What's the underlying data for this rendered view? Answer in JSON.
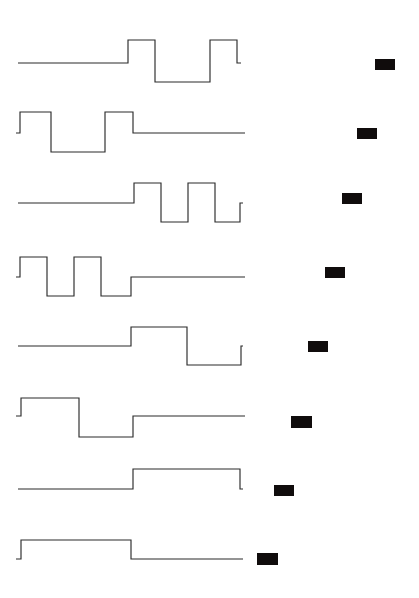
{
  "figure": {
    "title": "Digital waveform timing diagram",
    "background_color": "#ffffff",
    "trace_color": "#2b2b2b",
    "marker_color": "#100c0c",
    "width": 419,
    "height": 598
  },
  "chart_data": {
    "type": "line",
    "title": "Digital waveform timing diagram",
    "subtitle": "",
    "xlabel": "",
    "ylabel": "",
    "grid": false,
    "legend": "none",
    "xlim": [
      0,
      419
    ],
    "ylim": [
      0,
      598
    ],
    "level_names": [
      "low",
      "mid",
      "high"
    ],
    "series": [
      {
        "name": "trace-1",
        "row_index": 1,
        "baseline_y": 63,
        "levels": {
          "high": 40,
          "mid": 63,
          "low": 82
        },
        "x_start": 18,
        "x_end": 241,
        "segments": [
          {
            "x0": 18,
            "x1": 128,
            "level": "mid"
          },
          {
            "x0": 128,
            "x1": 155,
            "level": "high"
          },
          {
            "x0": 155,
            "x1": 210,
            "level": "low"
          },
          {
            "x0": 210,
            "x1": 237,
            "level": "high"
          },
          {
            "x0": 237,
            "x1": 241,
            "level": "mid"
          }
        ],
        "marker": {
          "x": 375,
          "y": 59,
          "width": 20,
          "height": 11
        }
      },
      {
        "name": "trace-2",
        "row_index": 2,
        "baseline_y": 133,
        "levels": {
          "high": 112,
          "mid": 133,
          "low": 152
        },
        "x_start": 16,
        "x_end": 245,
        "segments": [
          {
            "x0": 16,
            "x1": 20,
            "level": "mid"
          },
          {
            "x0": 20,
            "x1": 51,
            "level": "high"
          },
          {
            "x0": 51,
            "x1": 105,
            "level": "low"
          },
          {
            "x0": 105,
            "x1": 133,
            "level": "high"
          },
          {
            "x0": 133,
            "x1": 245,
            "level": "mid"
          }
        ],
        "marker": {
          "x": 357,
          "y": 128,
          "width": 20,
          "height": 11
        }
      },
      {
        "name": "trace-3",
        "row_index": 3,
        "baseline_y": 203,
        "levels": {
          "high": 183,
          "mid": 203,
          "low": 222
        },
        "x_start": 18,
        "x_end": 243,
        "segments": [
          {
            "x0": 18,
            "x1": 134,
            "level": "mid"
          },
          {
            "x0": 134,
            "x1": 161,
            "level": "high"
          },
          {
            "x0": 161,
            "x1": 188,
            "level": "low"
          },
          {
            "x0": 188,
            "x1": 215,
            "level": "high"
          },
          {
            "x0": 215,
            "x1": 240,
            "level": "low"
          },
          {
            "x0": 240,
            "x1": 243,
            "level": "mid"
          }
        ],
        "marker": {
          "x": 342,
          "y": 193,
          "width": 20,
          "height": 11
        }
      },
      {
        "name": "trace-4",
        "row_index": 4,
        "baseline_y": 277,
        "levels": {
          "high": 257,
          "mid": 277,
          "low": 296
        },
        "x_start": 16,
        "x_end": 245,
        "segments": [
          {
            "x0": 16,
            "x1": 20,
            "level": "mid"
          },
          {
            "x0": 20,
            "x1": 47,
            "level": "high"
          },
          {
            "x0": 47,
            "x1": 74,
            "level": "low"
          },
          {
            "x0": 74,
            "x1": 101,
            "level": "high"
          },
          {
            "x0": 101,
            "x1": 131,
            "level": "low"
          },
          {
            "x0": 131,
            "x1": 245,
            "level": "mid"
          }
        ],
        "marker": {
          "x": 325,
          "y": 267,
          "width": 20,
          "height": 11
        }
      },
      {
        "name": "trace-5",
        "row_index": 5,
        "baseline_y": 346,
        "levels": {
          "high": 327,
          "mid": 346,
          "low": 365
        },
        "x_start": 18,
        "x_end": 243,
        "segments": [
          {
            "x0": 18,
            "x1": 131,
            "level": "mid"
          },
          {
            "x0": 131,
            "x1": 187,
            "level": "high"
          },
          {
            "x0": 187,
            "x1": 241,
            "level": "low"
          },
          {
            "x0": 241,
            "x1": 243,
            "level": "mid"
          }
        ],
        "marker": {
          "x": 308,
          "y": 341,
          "width": 20,
          "height": 11
        }
      },
      {
        "name": "trace-6",
        "row_index": 6,
        "baseline_y": 416,
        "levels": {
          "high": 398,
          "mid": 416,
          "low": 437
        },
        "x_start": 16,
        "x_end": 245,
        "segments": [
          {
            "x0": 16,
            "x1": 21,
            "level": "mid"
          },
          {
            "x0": 21,
            "x1": 79,
            "level": "high"
          },
          {
            "x0": 79,
            "x1": 133,
            "level": "low"
          },
          {
            "x0": 133,
            "x1": 245,
            "level": "mid"
          }
        ],
        "marker": {
          "x": 291,
          "y": 416,
          "width": 21,
          "height": 12
        }
      },
      {
        "name": "trace-7",
        "row_index": 7,
        "baseline_y": 489,
        "levels": {
          "high": 469,
          "mid": 489,
          "low": 489
        },
        "x_start": 18,
        "x_end": 243,
        "segments": [
          {
            "x0": 18,
            "x1": 133,
            "level": "mid"
          },
          {
            "x0": 133,
            "x1": 240,
            "level": "high"
          },
          {
            "x0": 240,
            "x1": 243,
            "level": "mid"
          }
        ],
        "marker": {
          "x": 274,
          "y": 485,
          "width": 20,
          "height": 11
        }
      },
      {
        "name": "trace-8",
        "row_index": 8,
        "baseline_y": 559,
        "levels": {
          "high": 540,
          "mid": 559,
          "low": 559
        },
        "x_start": 16,
        "x_end": 243,
        "segments": [
          {
            "x0": 16,
            "x1": 21,
            "level": "mid"
          },
          {
            "x0": 21,
            "x1": 131,
            "level": "high"
          },
          {
            "x0": 131,
            "x1": 243,
            "level": "mid"
          }
        ],
        "marker": {
          "x": 257,
          "y": 553,
          "width": 21,
          "height": 12
        }
      }
    ]
  }
}
